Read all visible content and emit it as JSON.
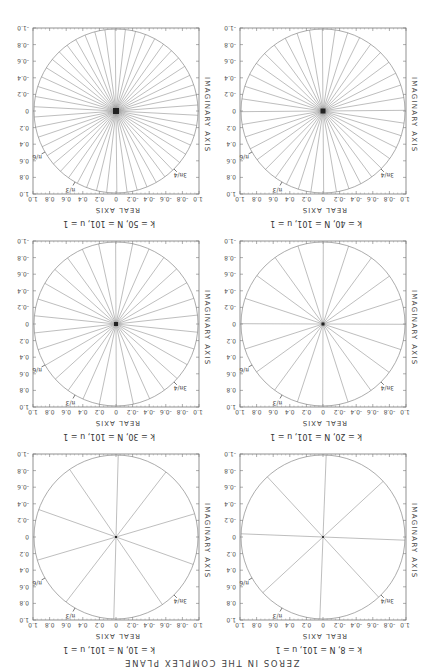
{
  "figure": {
    "title": "ZEROS IN THE COMPLEX PLANE",
    "orientation_deg": 180
  },
  "axes": {
    "xlabel": "REAL AXIS",
    "ylabel": "IMAGINARY AXIS",
    "xticks": [
      "-1.0",
      "-0.8",
      "-0.6",
      "-0.4",
      "-0.2",
      "0",
      "0.2",
      "0.4",
      "0.6",
      "0.8",
      "1.0"
    ],
    "yticks": [
      "1.0",
      "0.8",
      "0.6",
      "0.4",
      "0.2",
      "0",
      "-0.2",
      "-0.4",
      "-0.6",
      "-0.8",
      "-1.0"
    ]
  },
  "annotations": [
    "π/6",
    "π/3",
    "3π/4"
  ],
  "panels": [
    {
      "label": "k = 8, N = 101, u = 1",
      "k": 8
    },
    {
      "label": "k = 10, N = 101, u = 1",
      "k": 10
    },
    {
      "label": "k = 20, N = 101, u = 1",
      "k": 20
    },
    {
      "label": "k = 30, N = 101, u = 1",
      "k": 30
    },
    {
      "label": "k = 40, N = 101, u = 1",
      "k": 40
    },
    {
      "label": "k = 50, N = 101, u = 1",
      "k": 50
    }
  ],
  "chart_data": {
    "type": "scatter",
    "title": "ZEROS IN THE COMPLEX PLANE",
    "xlabel": "REAL AXIS",
    "ylabel": "IMAGINARY AXIS",
    "xlim": [
      -1.0,
      1.0
    ],
    "ylim": [
      -1.0,
      1.0
    ],
    "grid": false,
    "subplots": [
      {
        "title": "k = 8, N = 101, u = 1",
        "radial_lines": 8,
        "unit_circle": true
      },
      {
        "title": "k = 10, N = 101, u = 1",
        "radial_lines": 10,
        "unit_circle": true
      },
      {
        "title": "k = 20, N = 101, u = 1",
        "radial_lines": 20,
        "unit_circle": true
      },
      {
        "title": "k = 30, N = 101, u = 1",
        "radial_lines": 30,
        "unit_circle": true
      },
      {
        "title": "k = 40, N = 101, u = 1",
        "radial_lines": 40,
        "unit_circle": true
      },
      {
        "title": "k = 50, N = 101, u = 1",
        "radial_lines": 50,
        "unit_circle": true
      }
    ],
    "annotations": [
      "π/6",
      "π/3",
      "3π/4"
    ]
  }
}
